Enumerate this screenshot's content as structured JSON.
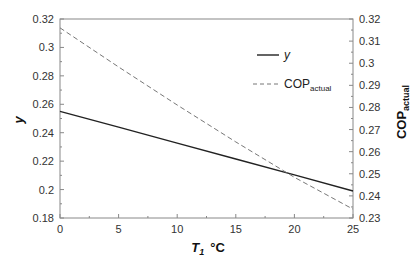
{
  "chart_data": {
    "type": "line",
    "title": "",
    "xlabel": "T",
    "xlabel_sub": "1",
    "xlabel_unit": "°C",
    "ylabel": "y",
    "y2label": "COP",
    "y2label_sub": "actual",
    "xlim": [
      0,
      25
    ],
    "ylim": [
      0.18,
      0.32
    ],
    "y2lim": [
      0.23,
      0.32
    ],
    "xticks": [
      "0",
      "5",
      "10",
      "15",
      "20",
      "25"
    ],
    "yticks": [
      "0.18",
      "0.2",
      "0.22",
      "0.24",
      "0.26",
      "0.28",
      "0.3",
      "0.32"
    ],
    "y2ticks": [
      "0.23",
      "0.24",
      "0.25",
      "0.26",
      "0.27",
      "0.28",
      "0.29",
      "0.3",
      "0.31",
      "0.32"
    ],
    "grid": false,
    "legend_position": "top-right",
    "series": [
      {
        "name": "y",
        "axis": "left",
        "style": "solid",
        "color": "#222222",
        "x": [
          0,
          5,
          10,
          15,
          20,
          25
        ],
        "values": [
          0.255,
          0.2439,
          0.2327,
          0.2215,
          0.2103,
          0.199
        ]
      },
      {
        "name": "COPactual",
        "name_main": "COP",
        "name_sub": "actual",
        "axis": "right",
        "style": "dashed",
        "color": "#777777",
        "x": [
          0,
          5,
          10,
          15,
          20,
          25
        ],
        "values": [
          0.316,
          0.2983,
          0.2811,
          0.2644,
          0.2484,
          0.234
        ]
      }
    ]
  }
}
